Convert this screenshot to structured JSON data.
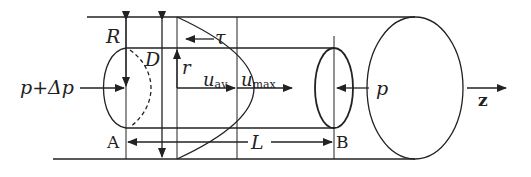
{
  "diagram": {
    "type": "pipe-flow-laminar-velocity-profile",
    "labels": {
      "R": "R",
      "D": "D",
      "r": "r",
      "tau": "τ",
      "u_av": "u",
      "u_av_sub": "av",
      "u_max": "u",
      "u_max_sub": "max",
      "p_in": "p+Δp",
      "p_out": "p",
      "A": "A",
      "B": "B",
      "L": "L",
      "z": "z"
    },
    "colors": {
      "stroke": "#222222",
      "background": "#ffffff"
    }
  }
}
